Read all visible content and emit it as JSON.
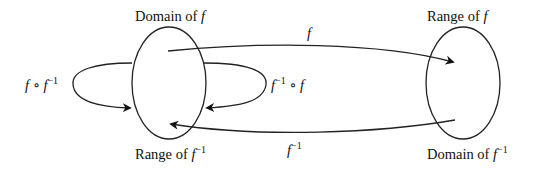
{
  "diagram": {
    "nodes": [
      {
        "id": "left-set",
        "top_label": "Domain of",
        "top_var": "f",
        "bottom_label": "Range of",
        "bottom_var": "f",
        "bottom_sup": "−1"
      },
      {
        "id": "right-set",
        "top_label": "Range of",
        "top_var": "f",
        "bottom_label": "Domain of",
        "bottom_var": "f",
        "bottom_sup": "−1"
      }
    ],
    "edges": [
      {
        "id": "f",
        "from": "left-set",
        "to": "right-set",
        "label_var": "f"
      },
      {
        "id": "f-inverse",
        "from": "right-set",
        "to": "left-set",
        "label_var": "f",
        "label_sup": "−1"
      },
      {
        "id": "f-of-f-inverse",
        "from": "left-set",
        "to": "left-set",
        "label_a": "f",
        "op": "∘",
        "label_b": "f",
        "label_b_sup": "−1"
      },
      {
        "id": "f-inverse-of-f",
        "from": "left-set",
        "to": "left-set",
        "label_a": "f",
        "label_a_sup": "−1",
        "op": "∘",
        "label_b": "f"
      }
    ]
  }
}
